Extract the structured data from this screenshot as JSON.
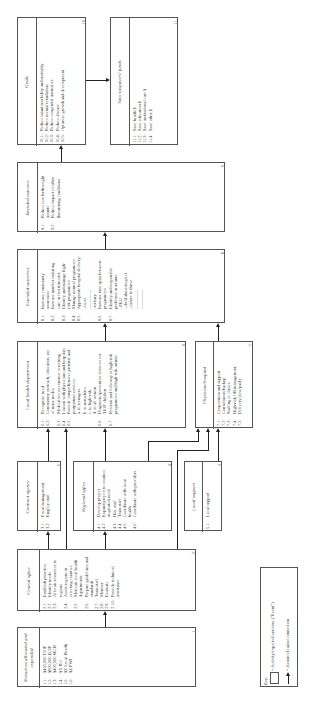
{
  "boxes": {
    "goals": {
      "title": "Goals",
      "number": "10",
      "items": [
        {
          "n": "10.1:",
          "t": "Reduce infant morbidity and mortality"
        },
        {
          "n": "10.2:",
          "t": "Reduce mental retardation"
        },
        {
          "n": "10.3:",
          "t": "Reduce congenital anomalies"
        },
        {
          "n": "10.4:",
          "t": "Reduce disease"
        },
        {
          "n": "10.5:",
          "t": "Optimize growth and development"
        }
      ]
    },
    "save_funds": {
      "title": "Save taxpayers' funds",
      "number": "11",
      "items": [
        {
          "n": "11.1:",
          "t": "Save health $"
        },
        {
          "n": "11.2:",
          "t": "Save education $"
        },
        {
          "n": "11.3:",
          "t": "Save institutional care $"
        },
        {
          "n": "11.4:",
          "t": "Save other $"
        }
      ]
    },
    "intended_outcome": {
      "title": "Intended outcome",
      "number": "9",
      "items": [
        {
          "n": "9.1:",
          "t": "Reduce low birthweight infants"
        },
        {
          "n": "9.2:",
          "t": "Reduce impact of other threatening conditions"
        }
      ]
    },
    "extended_outcomes": {
      "title": "Extended outcomes",
      "number": "8",
      "items": [
        {
          "n": "8.1:",
          "t": "Increase community awareness"
        },
        {
          "n": "8.2:",
          "t": "Increase number initiating care in first trimester"
        },
        {
          "n": "8.3:",
          "t": "Identify and manage high-risk pregnancies"
        },
        {
          "n": "8.4:",
          "t": "Manage normal pregnancies"
        },
        {
          "n": "8.5:",
          "t": "Appropriate hospital delivery:\n–local\n–————\n–tertiary"
        },
        {
          "n": "8.6:",
          "t": "Increase time span between pregnancies"
        },
        {
          "n": "8.7:",
          "t": "Identify and respond to problems in infants:\n–PKU\n–child abuse/neglect\n–failure to thrive\n–————\n–————"
        }
      ]
    },
    "local_health": {
      "title": "Local health department",
      "number": "6",
      "items": [
        {
          "n": "6.1:",
          "t": "Recognize need"
        },
        {
          "n": "6.2:",
          "t": "Community outreach, education, use of mass media"
        },
        {
          "n": "6.3:",
          "t": "Medical/socioeconomic screening"
        },
        {
          "n": "6.4:",
          "t": "Liaison with physicians and hospitals"
        },
        {
          "n": "6.5:",
          "t": "Provide comprehensive prenatal and postpartum services\na. to teenagers\nb. to nonwhites\nc. to high-risk\nd. to all women"
        },
        {
          "n": "6.6:",
          "t": "Diagnostic/preventive services for TIOP children"
        },
        {
          "n": "6.7:",
          "t": "Referral and followup of high-risk pregnancies and high-risk infants"
        }
      ]
    },
    "physician": {
      "title": "Physician/hospital",
      "number": "7",
      "items": [
        {
          "n": "7.1:",
          "t": "Cooperation and support"
        },
        {
          "n": "7.2:",
          "t": "Consultation/backup"
        },
        {
          "n": "7.3:",
          "t": "Staffing of clinics"
        },
        {
          "n": "7.4:",
          "t": "High-risk OB management"
        },
        {
          "n": "7.5:",
          "t": "Delivery (low/paid)"
        }
      ]
    },
    "contract_agency": {
      "title": "Contract agency",
      "number": "5",
      "items": [
        {
          "n": "3.1:",
          "t": "Fiscal management"
        },
        {
          "n": "3.2:",
          "t": "Employ staff"
        }
      ]
    },
    "regional_office": {
      "title": "Regional office",
      "number": "4",
      "items": [
        {
          "n": "4.1:",
          "t": "Develop project"
        },
        {
          "n": "4.2:",
          "t": "Expand project to counties in greatest need"
        },
        {
          "n": "4.3:",
          "t": "Hire staff"
        },
        {
          "n": "4.4:",
          "t": "Train staff"
        },
        {
          "n": "4.5:",
          "t": "Coordinate with local health"
        },
        {
          "n": "4.6:",
          "t": "Coordinate with providers"
        }
      ]
    },
    "local_support": {
      "title": "Local support",
      "number": "3",
      "items": [
        {
          "n": "5.1:",
          "t": "Local support"
        }
      ]
    },
    "central_office": {
      "title": "Central office",
      "number": "2",
      "items": [
        {
          "n": "2.1:",
          "t": "Establish priorities"
        },
        {
          "n": "2.2:",
          "t": "Identify needs"
        },
        {
          "n": "2.3:",
          "t": "Allocate resources to regions"
        },
        {
          "n": "2.4:",
          "t": "Assist regions in selecting counties"
        },
        {
          "n": "2.5:",
          "t": "Motivate local health departments"
        },
        {
          "n": "2.6:",
          "t": "Prepare guidelines and standards"
        },
        {
          "n": "2.7:",
          "t": "Train staff"
        },
        {
          "n": "2.8:",
          "t": "Monitor"
        },
        {
          "n": "2.9:",
          "t": "Evaluate"
        },
        {
          "n": "2.10:",
          "t": "Provide technical assistance"
        }
      ]
    },
    "resources": {
      "title": "Resources allocated and expended",
      "number": "1",
      "items": [
        {
          "n": "1.1:",
          "t": "$400,000 TIOP"
        },
        {
          "n": "1.2:",
          "t": "$800,000 ECIP"
        },
        {
          "n": "1.3:",
          "t": "$400,000 MCH"
        },
        {
          "n": "1.4:",
          "t": "$X         RO"
        },
        {
          "n": "1.5:",
          "t": "$Y     Local Health"
        },
        {
          "n": "1.6:",
          "t": "$Z        PWJ"
        }
      ]
    }
  },
  "key": {
    "label": "Key:",
    "box_text": "= Activity/expected outcome (\"Event\")",
    "arrow_text": "= Assumed causal connection"
  }
}
